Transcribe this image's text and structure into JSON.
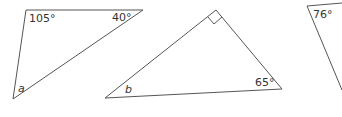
{
  "triangles": [
    {
      "id": "triangle-1",
      "labels": {
        "top_left": "105°",
        "top_right": "40°",
        "bottom": "a"
      }
    },
    {
      "id": "triangle-2",
      "labels": {
        "right_angle_marker": "right-angle",
        "bottom_left": "b",
        "bottom_right": "65°"
      }
    },
    {
      "id": "triangle-3",
      "labels": {
        "top_left": "76°"
      }
    }
  ]
}
